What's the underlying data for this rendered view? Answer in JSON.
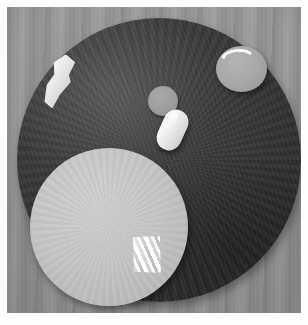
{
  "image": {
    "kind": "photograph",
    "subject": "Objects arranged on a dark round mat on a wooden table",
    "palette": "grayscale",
    "frame_color": "#fdfdfd",
    "width": 308,
    "height": 325
  },
  "scene": {
    "background": {
      "name": "wooden table surface",
      "grain_direction": "vertical",
      "color": "#949390"
    },
    "objects": [
      {
        "id": "dark-mat",
        "label": "large dark circular mat",
        "shape": "circle",
        "color": "#3b3a39",
        "center": [
          152,
          153
        ],
        "radius": 142
      },
      {
        "id": "light-disc",
        "label": "large light gray disc",
        "shape": "circle",
        "color": "#c6c4bf",
        "center": [
          109,
          227
        ],
        "radius": 79
      },
      {
        "id": "gray-disc",
        "label": "small gray disc",
        "shape": "ellipse",
        "color": "#a9a7a2",
        "center": [
          241,
          69
        ],
        "radius": 25
      },
      {
        "id": "small-circle",
        "label": "small gray circle",
        "shape": "circle",
        "color": "#9d9b96",
        "center": [
          163,
          101
        ],
        "radius": 15
      },
      {
        "id": "white-chunk",
        "label": "irregular white chunk",
        "shape": "irregular",
        "color": "#eceae5",
        "center": [
          57,
          81
        ]
      },
      {
        "id": "white-capsule",
        "label": "white oval capsule",
        "shape": "oval",
        "color": "#efeee9",
        "center": [
          172,
          130
        ]
      },
      {
        "id": "white-crescent",
        "label": "white curved sliver",
        "shape": "crescent",
        "color": "#f1efea",
        "center": [
          237,
          57
        ]
      },
      {
        "id": "striped-object",
        "label": "translucent ridged object",
        "shape": "quadrilateral",
        "color": "#ffffff",
        "center": [
          146,
          255
        ]
      }
    ]
  }
}
